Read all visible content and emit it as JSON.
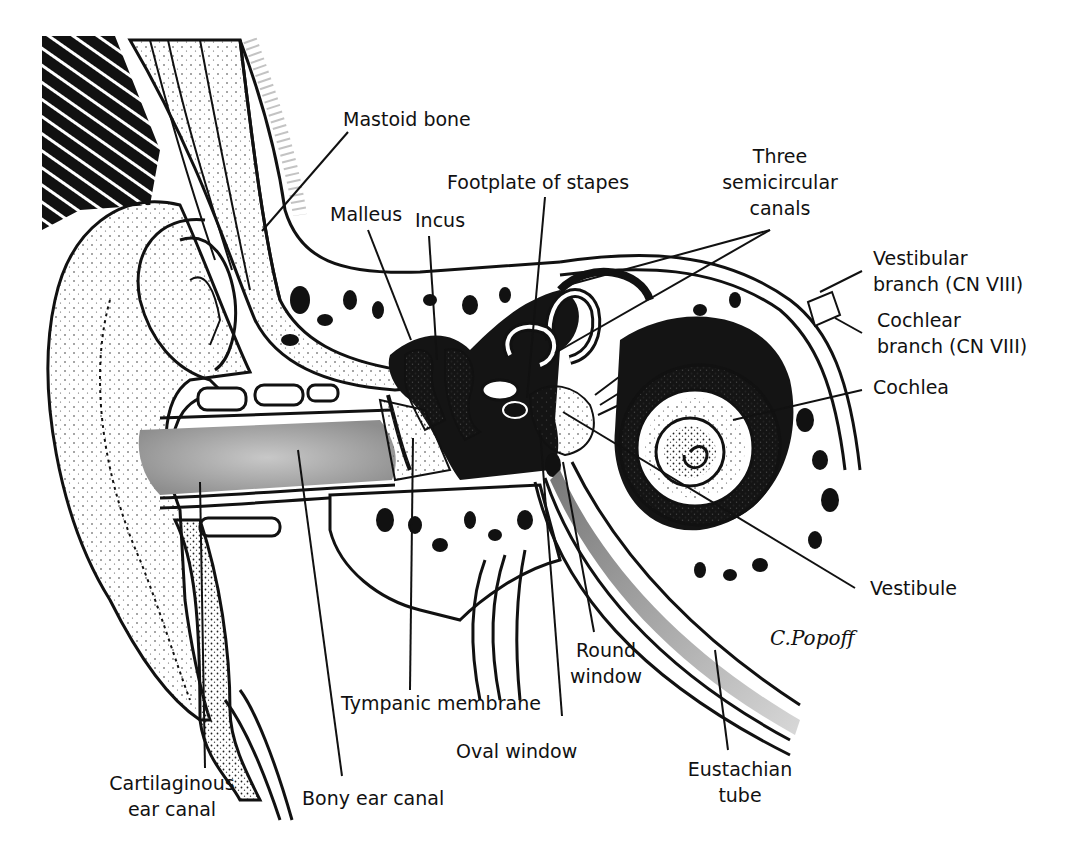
{
  "diagram": {
    "type": "anatomical cross-section",
    "signature": "C.Popoff",
    "colors": {
      "ink": "#111111",
      "background": "#ffffff",
      "stipple_gray": "#9a9a9a",
      "dark_fill": "#141414"
    }
  },
  "labels": {
    "mastoid_bone": {
      "line1": "Mastoid bone"
    },
    "malleus": {
      "line1": "Malleus"
    },
    "incus": {
      "line1": "Incus"
    },
    "footplate_stapes": {
      "line1": "Footplate of stapes"
    },
    "semicircular_canals": {
      "line1": "Three",
      "line2": "semicircular",
      "line3": "canals"
    },
    "vestibular_branch": {
      "line1": "Vestibular",
      "line2": "branch (CN VIII)"
    },
    "cochlear_branch": {
      "line1": "Cochlear",
      "line2": "branch (CN VIII)"
    },
    "cochlea": {
      "line1": "Cochlea"
    },
    "vestibule": {
      "line1": "Vestibule"
    },
    "round_window": {
      "line1": "Round",
      "line2": "window"
    },
    "tympanic_membrane": {
      "line1": "Tympanic membrane"
    },
    "oval_window": {
      "line1": "Oval window"
    },
    "eustachian_tube": {
      "line1": "Eustachian",
      "line2": "tube"
    },
    "cartilaginous_canal": {
      "line1": "Cartilaginous",
      "line2": "ear canal"
    },
    "bony_canal": {
      "line1": "Bony ear canal"
    }
  }
}
